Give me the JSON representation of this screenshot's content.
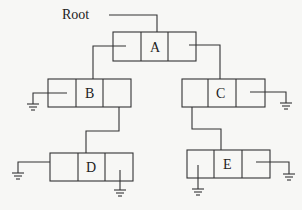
{
  "diagram": {
    "type": "binary-tree-linked-list",
    "root_label": "Root",
    "nodes": [
      {
        "id": "A",
        "label": "A",
        "x": 113,
        "y": 32
      },
      {
        "id": "B",
        "label": "B",
        "x": 48,
        "y": 79
      },
      {
        "id": "C",
        "label": "C",
        "x": 182,
        "y": 79
      },
      {
        "id": "D",
        "label": "D",
        "x": 50,
        "y": 153
      },
      {
        "id": "E",
        "label": "E",
        "x": 187,
        "y": 150
      }
    ],
    "edges": [
      {
        "from": "Root",
        "to": "A"
      },
      {
        "from": "A",
        "to": "B",
        "side": "left"
      },
      {
        "from": "A",
        "to": "C",
        "side": "right"
      },
      {
        "from": "B",
        "to": "D",
        "side": "right"
      },
      {
        "from": "C",
        "to": "E",
        "side": "left"
      }
    ],
    "null_pointers": [
      "B.left",
      "C.right",
      "D.left",
      "D.right",
      "E.left",
      "E.right"
    ]
  }
}
